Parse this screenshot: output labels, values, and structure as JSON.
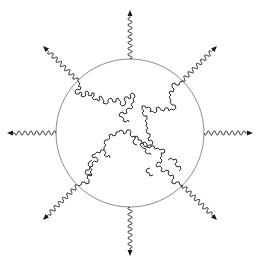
{
  "diagram": {
    "type": "schematic",
    "background": "#ffffff",
    "circle": {
      "cx": 130,
      "cy": 133,
      "r": 74,
      "stroke": "#8a8a8a",
      "stroke_width": 1
    },
    "chain_color": "#1a1a1a",
    "arrow_color": "#1a1a1a",
    "arrows": [
      {
        "name": "arrow-north",
        "angle_deg": -90
      },
      {
        "name": "arrow-northeast",
        "angle_deg": -45
      },
      {
        "name": "arrow-east",
        "angle_deg": 0
      },
      {
        "name": "arrow-southeast",
        "angle_deg": 45
      },
      {
        "name": "arrow-south",
        "angle_deg": 90
      },
      {
        "name": "arrow-southwest",
        "angle_deg": 135
      },
      {
        "name": "arrow-west",
        "angle_deg": 180
      },
      {
        "name": "arrow-northwest",
        "angle_deg": -135
      }
    ],
    "chains": [
      {
        "name": "chain-upper-left",
        "from": "circle edge at ~135deg (upper-left)",
        "to": "near center"
      },
      {
        "name": "chain-upper-right",
        "from": "circle edge at ~45deg (upper-right)",
        "to": "near center"
      },
      {
        "name": "chain-lower-left",
        "from": "circle edge at ~225deg (lower-left)",
        "to": "near center"
      },
      {
        "name": "chain-lower-right",
        "from": "circle edge at ~315deg (lower-right)",
        "to": "near center"
      }
    ]
  }
}
